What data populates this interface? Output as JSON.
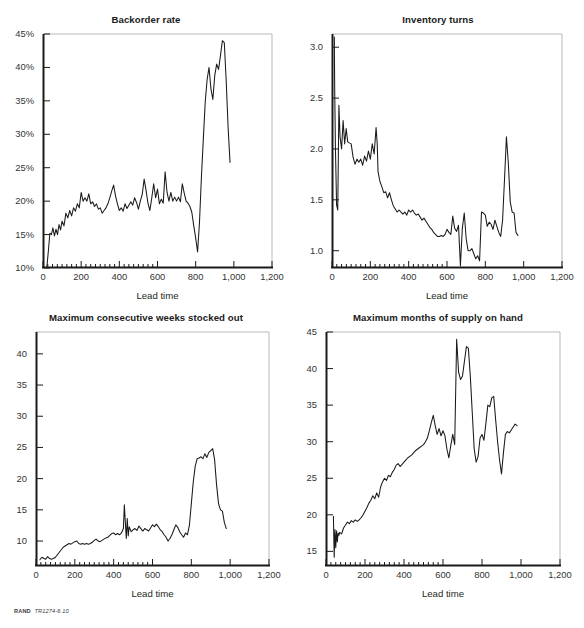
{
  "figure": {
    "clipped_top_text": "",
    "credit_brand": "RAND",
    "credit_code": "TR1274-6.10",
    "axis_title": "Lead time",
    "colors": {
      "line": "#1a1a1a",
      "axis": "#1a1a1a",
      "frame": "#b9b9b9",
      "text": "#231f20"
    }
  },
  "panels": [
    {
      "id": "backorder-rate",
      "title": "Backorder rate",
      "xlabel": "Lead time",
      "ylabel": "",
      "ytick_labels": [
        "10%",
        "15%",
        "20%",
        "25%",
        "30%",
        "35%",
        "40%",
        "45%"
      ],
      "xtick_labels": [
        "0",
        "200",
        "400",
        "600",
        "800",
        "1,000",
        "1,200"
      ]
    },
    {
      "id": "inventory-turns",
      "title": "Inventory turns",
      "xlabel": "Lead time",
      "ylabel": "",
      "ytick_labels": [
        "1.0",
        "1.5",
        "2.0",
        "2.5",
        "3.0"
      ],
      "xtick_labels": [
        "0",
        "200",
        "400",
        "600",
        "800",
        "1,000",
        "1,200"
      ]
    },
    {
      "id": "max-consecutive-weeks-stocked-out",
      "title": "Maximum consecutive weeks stocked out",
      "xlabel": "Lead time",
      "ylabel": "",
      "ytick_labels": [
        "10",
        "15",
        "20",
        "25",
        "30",
        "35",
        "40"
      ],
      "xtick_labels": [
        "0",
        "200",
        "400",
        "600",
        "800",
        "1,000",
        "1,200"
      ]
    },
    {
      "id": "max-months-of-supply-on-hand",
      "title": "Maximum months of supply on hand",
      "xlabel": "Lead time",
      "ylabel": "",
      "ytick_labels": [
        "15",
        "20",
        "25",
        "30",
        "35",
        "40",
        "45"
      ],
      "xtick_labels": [
        "0",
        "200",
        "400",
        "600",
        "800",
        "1,000",
        "1,200"
      ]
    }
  ],
  "chart_data": [
    {
      "type": "line",
      "title": "Backorder rate",
      "xlabel": "Lead time",
      "ylabel": "",
      "xlim": [
        0,
        1200
      ],
      "ylim": [
        0.1,
        0.45
      ],
      "yticks": [
        0.1,
        0.15,
        0.2,
        0.25,
        0.3,
        0.35,
        0.4,
        0.45
      ],
      "ytick_labels": [
        "10%",
        "15%",
        "20%",
        "25%",
        "30%",
        "35%",
        "40%",
        "45%"
      ],
      "xticks": [
        0,
        200,
        400,
        600,
        800,
        1000,
        1200
      ],
      "xtick_labels": [
        "0",
        "200",
        "400",
        "600",
        "800",
        "1,000",
        "1,200"
      ],
      "grid": false,
      "legend": "none",
      "series": [
        {
          "name": "Backorder rate",
          "x": [
            20,
            28,
            36,
            44,
            52,
            60,
            68,
            76,
            84,
            92,
            100,
            110,
            120,
            130,
            140,
            150,
            160,
            170,
            180,
            190,
            200,
            210,
            220,
            230,
            240,
            250,
            260,
            270,
            280,
            290,
            300,
            310,
            320,
            330,
            340,
            350,
            360,
            370,
            380,
            390,
            400,
            410,
            420,
            430,
            440,
            450,
            460,
            470,
            480,
            490,
            500,
            510,
            520,
            530,
            540,
            550,
            560,
            570,
            580,
            590,
            600,
            610,
            620,
            630,
            640,
            650,
            660,
            670,
            680,
            690,
            700,
            710,
            720,
            730,
            740,
            750,
            760,
            770,
            780,
            790,
            800,
            810,
            820,
            830,
            840,
            850,
            860,
            870,
            880,
            890,
            900,
            910,
            920,
            930,
            940,
            950,
            960,
            970,
            980
          ],
          "y": [
            0.101,
            0.125,
            0.152,
            0.15,
            0.16,
            0.148,
            0.158,
            0.15,
            0.165,
            0.157,
            0.17,
            0.163,
            0.182,
            0.175,
            0.186,
            0.178,
            0.19,
            0.185,
            0.196,
            0.19,
            0.213,
            0.2,
            0.205,
            0.2,
            0.211,
            0.196,
            0.199,
            0.192,
            0.196,
            0.188,
            0.19,
            0.182,
            0.186,
            0.19,
            0.196,
            0.205,
            0.215,
            0.224,
            0.208,
            0.196,
            0.186,
            0.19,
            0.185,
            0.196,
            0.189,
            0.194,
            0.199,
            0.194,
            0.205,
            0.198,
            0.188,
            0.2,
            0.21,
            0.233,
            0.216,
            0.197,
            0.186,
            0.205,
            0.226,
            0.205,
            0.218,
            0.196,
            0.203,
            0.197,
            0.244,
            0.213,
            0.2,
            0.213,
            0.2,
            0.206,
            0.2,
            0.206,
            0.199,
            0.226,
            0.212,
            0.2,
            0.197,
            0.192,
            0.183,
            0.163,
            0.145,
            0.124,
            0.168,
            0.235,
            0.292,
            0.348,
            0.382,
            0.4,
            0.368,
            0.352,
            0.388,
            0.405,
            0.397,
            0.418,
            0.44,
            0.437,
            0.38,
            0.31,
            0.258,
            0.272
          ]
        }
      ]
    },
    {
      "type": "line",
      "title": "Inventory turns",
      "xlabel": "Lead time",
      "ylabel": "",
      "xlim": [
        0,
        1200
      ],
      "ylim": [
        0.83,
        3.13
      ],
      "yticks": [
        1.0,
        1.5,
        2.0,
        2.5,
        3.0
      ],
      "ytick_labels": [
        "1.0",
        "1.5",
        "2.0",
        "2.5",
        "3.0"
      ],
      "xticks": [
        0,
        200,
        400,
        600,
        800,
        1000,
        1200
      ],
      "xtick_labels": [
        "0",
        "200",
        "400",
        "600",
        "800",
        "1,000",
        "1,200"
      ],
      "grid": false,
      "legend": "none",
      "series": [
        {
          "name": "Inventory turns",
          "x": [
            12,
            14,
            18,
            24,
            30,
            36,
            42,
            50,
            58,
            66,
            74,
            82,
            90,
            100,
            110,
            120,
            130,
            140,
            150,
            160,
            170,
            180,
            190,
            200,
            210,
            220,
            230,
            236,
            240,
            250,
            260,
            270,
            280,
            290,
            300,
            310,
            320,
            330,
            340,
            350,
            360,
            370,
            380,
            390,
            400,
            410,
            420,
            430,
            440,
            450,
            460,
            470,
            480,
            490,
            500,
            510,
            520,
            530,
            540,
            550,
            560,
            570,
            580,
            590,
            600,
            610,
            620,
            630,
            640,
            650,
            660,
            670,
            675,
            680,
            690,
            700,
            710,
            720,
            730,
            740,
            750,
            760,
            770,
            780,
            790,
            800,
            810,
            820,
            830,
            840,
            850,
            860,
            870,
            880,
            890,
            900,
            910,
            920,
            930,
            940,
            950,
            960,
            970,
            980
          ],
          "y": [
            3.1,
            2.6,
            2.0,
            1.45,
            1.4,
            2.43,
            2.12,
            2.0,
            2.28,
            2.05,
            2.2,
            2.07,
            2.06,
            2.05,
            1.92,
            1.85,
            1.9,
            1.87,
            1.9,
            1.84,
            1.93,
            1.88,
            1.98,
            1.9,
            2.05,
            1.95,
            2.21,
            2.05,
            1.78,
            1.68,
            1.63,
            1.57,
            1.58,
            1.52,
            1.57,
            1.5,
            1.44,
            1.41,
            1.38,
            1.4,
            1.38,
            1.36,
            1.38,
            1.35,
            1.4,
            1.38,
            1.4,
            1.37,
            1.35,
            1.36,
            1.33,
            1.3,
            1.32,
            1.29,
            1.26,
            1.23,
            1.21,
            1.18,
            1.16,
            1.14,
            1.14,
            1.15,
            1.14,
            1.16,
            1.21,
            1.18,
            1.16,
            1.34,
            1.22,
            1.19,
            1.25,
            0.85,
            1.04,
            1.22,
            1.37,
            1.12,
            1.0,
            1.0,
            1.02,
            0.97,
            0.92,
            0.95,
            0.9,
            1.38,
            1.37,
            1.35,
            1.24,
            1.28,
            1.26,
            1.21,
            1.3,
            1.24,
            1.18,
            1.14,
            1.3,
            1.7,
            2.12,
            1.86,
            1.48,
            1.38,
            1.37,
            1.18,
            1.15
          ]
        }
      ]
    },
    {
      "type": "line",
      "title": "Maximum consecutive weeks stocked out",
      "xlabel": "Lead time",
      "ylabel": "",
      "xlim": [
        0,
        1200
      ],
      "ylim": [
        6.0,
        43.5
      ],
      "yticks": [
        10,
        15,
        20,
        25,
        30,
        35,
        40
      ],
      "ytick_labels": [
        "10",
        "15",
        "20",
        "25",
        "30",
        "35",
        "40"
      ],
      "xticks": [
        0,
        200,
        400,
        600,
        800,
        1000,
        1200
      ],
      "xtick_labels": [
        "0",
        "200",
        "400",
        "600",
        "800",
        "1,000",
        "1,200"
      ],
      "grid": false,
      "legend": "none",
      "series": [
        {
          "name": "Maximum consecutive weeks stocked out",
          "x": [
            20,
            30,
            40,
            50,
            60,
            70,
            80,
            90,
            100,
            110,
            120,
            130,
            140,
            150,
            160,
            170,
            180,
            190,
            200,
            210,
            220,
            230,
            240,
            250,
            260,
            270,
            280,
            290,
            300,
            310,
            320,
            330,
            340,
            350,
            360,
            370,
            380,
            390,
            400,
            410,
            420,
            430,
            440,
            450,
            455,
            460,
            465,
            470,
            475,
            480,
            490,
            500,
            510,
            520,
            530,
            540,
            550,
            560,
            570,
            580,
            590,
            600,
            610,
            620,
            630,
            640,
            650,
            660,
            670,
            680,
            690,
            700,
            710,
            720,
            730,
            740,
            750,
            760,
            770,
            780,
            790,
            800,
            810,
            820,
            830,
            840,
            850,
            860,
            870,
            880,
            890,
            900,
            910,
            920,
            930,
            940,
            950,
            960,
            970,
            980
          ],
          "y": [
            7.0,
            7.4,
            7.2,
            7.1,
            7.5,
            7.2,
            7.1,
            7.2,
            7.4,
            7.8,
            8.2,
            8.6,
            9.0,
            9.2,
            9.4,
            9.6,
            9.5,
            9.7,
            9.9,
            10.0,
            9.6,
            9.5,
            9.6,
            9.5,
            9.6,
            9.5,
            9.6,
            9.8,
            10.1,
            10.3,
            10.0,
            9.9,
            10.1,
            10.3,
            10.5,
            10.6,
            10.9,
            11.2,
            11.3,
            11.0,
            11.2,
            11.0,
            11.3,
            12.0,
            15.8,
            13.0,
            10.4,
            13.6,
            10.8,
            12.3,
            11.5,
            11.8,
            12.0,
            11.7,
            12.4,
            12.0,
            11.6,
            12.0,
            11.8,
            11.6,
            12.1,
            12.6,
            12.3,
            12.7,
            12.3,
            11.8,
            11.5,
            11.0,
            10.6,
            10.0,
            10.4,
            11.0,
            11.8,
            12.6,
            12.2,
            11.5,
            11.0,
            10.6,
            11.3,
            11.0,
            12.5,
            16.0,
            19.5,
            22.0,
            23.2,
            23.3,
            23.5,
            23.2,
            24.0,
            23.4,
            24.2,
            24.5,
            24.8,
            23.0,
            19.0,
            16.0,
            15.0,
            14.8,
            13.0,
            12.0
          ]
        }
      ]
    },
    {
      "type": "line",
      "title": "Maximum months of supply on hand",
      "xlabel": "Lead time",
      "ylabel": "",
      "xlim": [
        0,
        1200
      ],
      "ylim": [
        13.0,
        45.0
      ],
      "yticks": [
        15,
        20,
        25,
        30,
        35,
        40,
        45
      ],
      "ytick_labels": [
        "15",
        "20",
        "25",
        "30",
        "35",
        "40",
        "45"
      ],
      "xticks": [
        0,
        200,
        400,
        600,
        800,
        1000,
        1200
      ],
      "xtick_labels": [
        "0",
        "200",
        "400",
        "600",
        "800",
        "1,000",
        "1,200"
      ],
      "grid": false,
      "legend": "none",
      "series": [
        {
          "name": "Maximum months of supply on hand",
          "x": [
            38,
            42,
            46,
            50,
            54,
            58,
            62,
            66,
            70,
            80,
            90,
            100,
            110,
            120,
            130,
            140,
            150,
            160,
            170,
            180,
            190,
            200,
            210,
            220,
            230,
            240,
            250,
            260,
            270,
            280,
            290,
            300,
            310,
            320,
            330,
            340,
            350,
            360,
            370,
            380,
            390,
            400,
            410,
            420,
            430,
            440,
            450,
            460,
            470,
            480,
            490,
            500,
            510,
            520,
            530,
            540,
            550,
            560,
            570,
            580,
            590,
            600,
            610,
            620,
            630,
            640,
            650,
            660,
            670,
            680,
            690,
            700,
            710,
            720,
            730,
            740,
            750,
            760,
            770,
            780,
            790,
            800,
            810,
            820,
            830,
            840,
            850,
            860,
            870,
            880,
            890,
            900,
            910,
            920,
            930,
            940,
            950,
            960,
            970,
            980
          ],
          "y": [
            19.8,
            14.2,
            18.0,
            15.5,
            17.8,
            16.3,
            17.5,
            17.2,
            17.6,
            17.4,
            18.2,
            18.6,
            19.0,
            18.8,
            19.2,
            19.0,
            19.3,
            19.1,
            19.3,
            19.6,
            20.0,
            20.5,
            21.0,
            21.6,
            22.0,
            22.6,
            22.2,
            23.0,
            22.4,
            23.8,
            24.5,
            25.0,
            24.7,
            25.4,
            25.2,
            25.8,
            26.2,
            26.8,
            27.0,
            26.6,
            26.9,
            27.2,
            27.5,
            27.8,
            28.0,
            28.2,
            28.5,
            28.8,
            29.0,
            29.2,
            29.4,
            29.6,
            30.0,
            30.5,
            31.5,
            32.6,
            33.6,
            32.2,
            31.0,
            31.8,
            30.8,
            31.5,
            30.8,
            29.0,
            27.8,
            29.5,
            31.0,
            29.6,
            44.0,
            39.5,
            38.5,
            39.0,
            41.0,
            43.0,
            42.8,
            39.0,
            34.0,
            29.0,
            27.2,
            28.0,
            30.5,
            31.0,
            30.2,
            32.5,
            35.0,
            34.8,
            36.0,
            36.2,
            33.0,
            30.0,
            27.5,
            25.6,
            28.5,
            31.0,
            31.4,
            31.2,
            31.6,
            32.0,
            32.4,
            32.2
          ]
        }
      ]
    }
  ]
}
